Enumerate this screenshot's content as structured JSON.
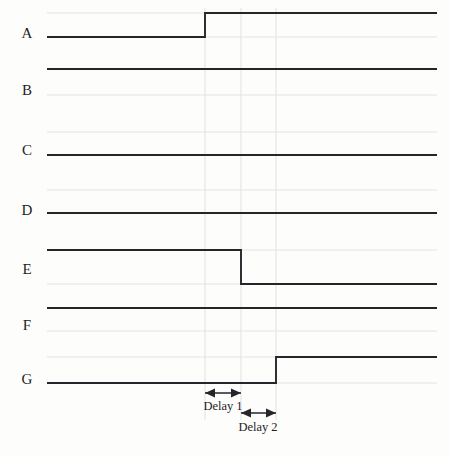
{
  "figure": {
    "type": "timing-diagram",
    "background_color": "#fdfdfc",
    "signal_color": "#26262a",
    "guide_color": "#e4e4e6",
    "text_color": "#1d1d1d",
    "plot_area": {
      "x_start": 47,
      "x_end": 437,
      "y_top": 8,
      "y_bottom": 390
    }
  },
  "row_labels": [
    {
      "text": "A",
      "x": 27,
      "y": 33
    },
    {
      "text": "B",
      "x": 27,
      "y": 90
    },
    {
      "text": "C",
      "x": 27,
      "y": 150
    },
    {
      "text": "D",
      "x": 27,
      "y": 210
    },
    {
      "text": "E",
      "x": 27,
      "y": 269
    },
    {
      "text": "F",
      "x": 27,
      "y": 325
    },
    {
      "text": "G",
      "x": 27,
      "y": 379
    }
  ],
  "markers": {
    "vertical_guides": [
      205,
      241,
      276
    ]
  },
  "annotations": [
    {
      "name": "delay-1",
      "label": "Delay 1",
      "from_x": 205,
      "to_x": 241,
      "arrow_y": 393,
      "label_x": 223,
      "label_y": 406
    },
    {
      "name": "delay-2",
      "label": "Delay 2",
      "from_x": 241,
      "to_x": 276,
      "arrow_y": 413,
      "label_x": 258,
      "label_y": 427
    }
  ],
  "chart_data": {
    "type": "line",
    "title": "",
    "xlabel": "",
    "ylabel": "",
    "grid": true,
    "legend_position": "none",
    "x_range": [
      47,
      437
    ],
    "signals": [
      {
        "name": "A",
        "high_y": 13,
        "low_y": 37,
        "initial_level": "low",
        "transitions": [
          {
            "x": 205,
            "to": "high"
          }
        ],
        "segments": [
          {
            "from_x": 47,
            "to_x": 205,
            "level": "low"
          },
          {
            "from_x": 205,
            "to_x": 437,
            "level": "high"
          }
        ]
      },
      {
        "name": "B",
        "high_y": 69,
        "low_y": 95,
        "initial_level": "high",
        "transitions": [],
        "segments": [
          {
            "from_x": 47,
            "to_x": 437,
            "level": "high"
          }
        ]
      },
      {
        "name": "C",
        "high_y": 132,
        "low_y": 155,
        "initial_level": "low",
        "transitions": [],
        "segments": [
          {
            "from_x": 47,
            "to_x": 437,
            "level": "low"
          }
        ]
      },
      {
        "name": "D",
        "high_y": 190,
        "low_y": 213,
        "initial_level": "low",
        "transitions": [],
        "segments": [
          {
            "from_x": 47,
            "to_x": 437,
            "level": "low"
          }
        ]
      },
      {
        "name": "E",
        "high_y": 250,
        "low_y": 284,
        "initial_level": "high",
        "transitions": [
          {
            "x": 241,
            "to": "low"
          }
        ],
        "segments": [
          {
            "from_x": 47,
            "to_x": 241,
            "level": "high"
          },
          {
            "from_x": 241,
            "to_x": 437,
            "level": "low"
          }
        ]
      },
      {
        "name": "F",
        "high_y": 308,
        "low_y": 331,
        "initial_level": "high",
        "transitions": [],
        "segments": [
          {
            "from_x": 47,
            "to_x": 437,
            "level": "high"
          }
        ]
      },
      {
        "name": "G",
        "high_y": 357,
        "low_y": 383,
        "initial_level": "low",
        "transitions": [
          {
            "x": 276,
            "to": "high"
          }
        ],
        "segments": [
          {
            "from_x": 47,
            "to_x": 276,
            "level": "low"
          },
          {
            "from_x": 276,
            "to_x": 437,
            "level": "high"
          }
        ]
      }
    ]
  }
}
